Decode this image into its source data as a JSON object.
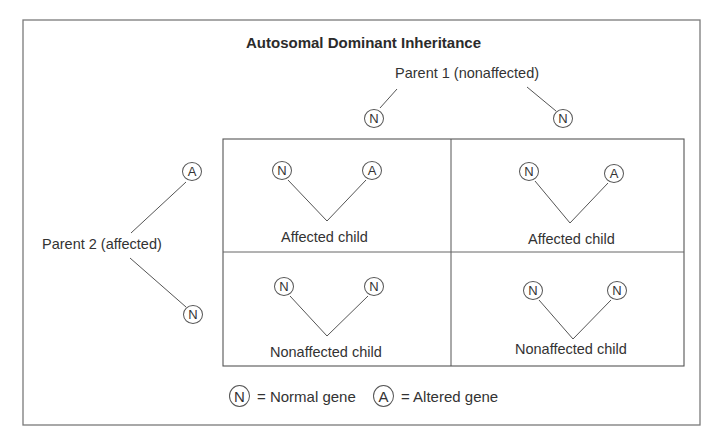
{
  "title": "Autosomal Dominant Inheritance",
  "colors": {
    "line": "#555555",
    "border": "#777777",
    "text": "#333333",
    "background": "#ffffff"
  },
  "parent1": {
    "label": "Parent 1 (nonaffected)",
    "genes": [
      {
        "symbol": "N"
      },
      {
        "symbol": "N"
      }
    ]
  },
  "parent2": {
    "label": "Parent 2 (affected)",
    "genes": [
      {
        "symbol": "A"
      },
      {
        "symbol": "N"
      }
    ]
  },
  "grid": {
    "cells": [
      {
        "position": "top-left",
        "genes": [
          "N",
          "A"
        ],
        "label": "Affected child"
      },
      {
        "position": "top-right",
        "genes": [
          "N",
          "A"
        ],
        "label": "Affected child"
      },
      {
        "position": "bottom-left",
        "genes": [
          "N",
          "N"
        ],
        "label": "Nonaffected child"
      },
      {
        "position": "bottom-right",
        "genes": [
          "N",
          "N"
        ],
        "label": "Nonaffected child"
      }
    ]
  },
  "legend": {
    "items": [
      {
        "symbol": "N",
        "text": "= Normal gene"
      },
      {
        "symbol": "A",
        "text": "= Altered gene"
      }
    ]
  }
}
